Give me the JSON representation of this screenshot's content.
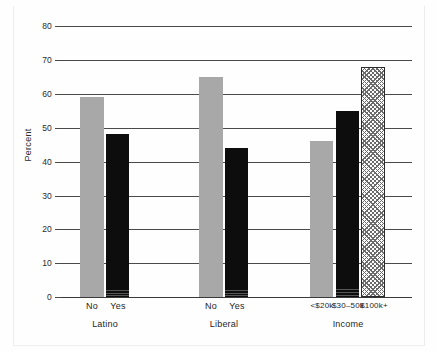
{
  "chart_data": {
    "type": "bar",
    "title": "",
    "subtitle": "",
    "xlabel": "",
    "ylabel": "Percent",
    "ylim": [
      0,
      80
    ],
    "ytick_step": 10,
    "yticks": [
      "0",
      "10",
      "20",
      "30",
      "40",
      "50",
      "60",
      "70",
      "80"
    ],
    "grid": true,
    "legend": "none",
    "groups": [
      {
        "name": "Latino",
        "categories": [
          "No",
          "Yes"
        ],
        "values": [
          59,
          48
        ],
        "styles": [
          "gray",
          "black"
        ]
      },
      {
        "name": "Liberal",
        "categories": [
          "No",
          "Yes"
        ],
        "values": [
          65,
          44
        ],
        "styles": [
          "gray",
          "black"
        ]
      },
      {
        "name": "Income",
        "categories": [
          "<$20k",
          "$30–50k",
          "$100k+"
        ],
        "values": [
          46,
          55,
          68
        ],
        "styles": [
          "gray",
          "black",
          "hatch"
        ]
      }
    ],
    "colors": {
      "gray_bar": "#a8a8a8",
      "black_bar": "#0d0d0d",
      "hatch_bar_fill": "#fdfdfd",
      "hatch_bar_line": "#6b6b6b",
      "axis": "#3a3a3a",
      "gridline": "#4a4a4a",
      "background": "#fefefe"
    }
  },
  "axis": {
    "y": {
      "label": "Percent",
      "ticks": [
        {
          "value": "0",
          "top": 297
        },
        {
          "value": "10",
          "top": 263
        },
        {
          "value": "20",
          "top": 229
        },
        {
          "value": "30",
          "top": 196
        },
        {
          "value": "40",
          "top": 162
        },
        {
          "value": "50",
          "top": 128
        },
        {
          "value": "60",
          "top": 94
        },
        {
          "value": "70",
          "top": 60
        },
        {
          "value": "80",
          "top": 26
        }
      ]
    }
  },
  "bars": [
    {
      "name": "latino-no",
      "label": "No",
      "value": 59,
      "style": "gray",
      "left": 80,
      "width": 24,
      "top": 97,
      "height": 200
    },
    {
      "name": "latino-yes",
      "label": "Yes",
      "value": 48,
      "style": "black",
      "left": 106,
      "width": 23,
      "top": 134,
      "height": 163
    },
    {
      "name": "liberal-no",
      "label": "No",
      "value": 65,
      "style": "gray",
      "left": 199,
      "width": 24,
      "top": 77,
      "height": 220
    },
    {
      "name": "liberal-yes",
      "label": "Yes",
      "value": 44,
      "style": "black",
      "left": 225,
      "width": 23,
      "top": 148,
      "height": 149
    },
    {
      "name": "income-under-20k",
      "label": "<$20k",
      "value": 46,
      "style": "gray",
      "left": 310,
      "width": 23,
      "top": 141,
      "height": 156
    },
    {
      "name": "income-30-50k",
      "label": "$30–50k",
      "value": 55,
      "style": "black",
      "left": 336,
      "width": 23,
      "top": 111,
      "height": 186
    },
    {
      "name": "income-100k-plus",
      "label": "$100k+",
      "value": 68,
      "style": "hatch",
      "left": 361,
      "width": 24,
      "top": 67,
      "height": 230
    }
  ],
  "category_labels": [
    {
      "name": "cat-latino-no",
      "text": "No",
      "center": 92,
      "small": false
    },
    {
      "name": "cat-latino-yes",
      "text": "Yes",
      "center": 118,
      "small": false
    },
    {
      "name": "cat-liberal-no",
      "text": "No",
      "center": 211,
      "small": false
    },
    {
      "name": "cat-liberal-yes",
      "text": "Yes",
      "center": 237,
      "small": false
    },
    {
      "name": "cat-income-under-20k",
      "text": "<$20k",
      "center": 322,
      "small": true
    },
    {
      "name": "cat-income-30-50k",
      "text": "$30–50k",
      "center": 348,
      "small": true
    },
    {
      "name": "cat-income-100k-plus",
      "text": "$100k+",
      "center": 374,
      "small": true
    }
  ],
  "group_labels": [
    {
      "name": "group-latino",
      "text": "Latino",
      "center": 105
    },
    {
      "name": "group-liberal",
      "text": "Liberal",
      "center": 224
    },
    {
      "name": "group-income",
      "text": "Income",
      "center": 348
    }
  ]
}
